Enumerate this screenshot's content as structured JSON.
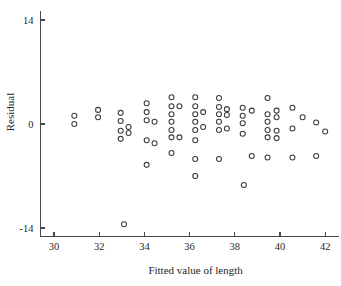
{
  "chart_data": {
    "type": "scatter",
    "title": "",
    "xlabel": "Fitted value of length",
    "ylabel": "Residual",
    "xlim": [
      29.4,
      42.6
    ],
    "ylim": [
      -15.2,
      15.2
    ],
    "xticks": [
      30,
      32,
      34,
      36,
      38,
      40,
      42
    ],
    "xticklabels": [
      "30",
      "32",
      "34",
      "36",
      "38",
      "40",
      "42"
    ],
    "yticks": [
      14,
      0,
      -14
    ],
    "yticklabels": [
      "14",
      "0",
      "-14"
    ],
    "grid": false,
    "legend": null,
    "marker": "open-circle",
    "marker_color": "#3b3b3b",
    "series": [
      {
        "name": "residuals",
        "points": [
          [
            30.9,
            1.1
          ],
          [
            30.9,
            0.0
          ],
          [
            31.95,
            1.9
          ],
          [
            31.95,
            0.9
          ],
          [
            32.95,
            1.5
          ],
          [
            32.95,
            0.4
          ],
          [
            32.95,
            -0.9
          ],
          [
            32.95,
            -2.0
          ],
          [
            33.3,
            -0.4
          ],
          [
            33.3,
            -1.2
          ],
          [
            33.1,
            -13.5
          ],
          [
            34.1,
            2.8
          ],
          [
            34.1,
            1.6
          ],
          [
            34.1,
            0.5
          ],
          [
            34.1,
            -2.2
          ],
          [
            34.45,
            0.3
          ],
          [
            34.45,
            -2.6
          ],
          [
            34.1,
            -5.5
          ],
          [
            35.2,
            3.6
          ],
          [
            35.2,
            2.4
          ],
          [
            35.2,
            1.3
          ],
          [
            35.2,
            0.3
          ],
          [
            35.2,
            -0.8
          ],
          [
            35.2,
            -1.8
          ],
          [
            35.2,
            -3.9
          ],
          [
            35.55,
            2.4
          ],
          [
            35.55,
            -1.8
          ],
          [
            36.25,
            3.6
          ],
          [
            36.25,
            2.4
          ],
          [
            36.25,
            1.3
          ],
          [
            36.25,
            0.3
          ],
          [
            36.25,
            -0.8
          ],
          [
            36.25,
            -2.2
          ],
          [
            36.25,
            -4.7
          ],
          [
            36.25,
            -7.0
          ],
          [
            36.6,
            1.6
          ],
          [
            36.6,
            -0.4
          ],
          [
            37.3,
            3.5
          ],
          [
            37.3,
            2.3
          ],
          [
            37.3,
            1.3
          ],
          [
            37.3,
            0.3
          ],
          [
            37.3,
            -0.8
          ],
          [
            37.3,
            -4.7
          ],
          [
            37.65,
            2.0
          ],
          [
            37.65,
            1.2
          ],
          [
            37.65,
            -0.6
          ],
          [
            38.35,
            2.2
          ],
          [
            38.35,
            1.1
          ],
          [
            38.35,
            0.1
          ],
          [
            38.35,
            -1.3
          ],
          [
            38.4,
            -8.2
          ],
          [
            38.75,
            1.8
          ],
          [
            38.75,
            -4.3
          ],
          [
            39.45,
            3.5
          ],
          [
            39.45,
            1.3
          ],
          [
            39.45,
            0.3
          ],
          [
            39.45,
            -0.8
          ],
          [
            39.45,
            -1.8
          ],
          [
            39.45,
            -4.5
          ],
          [
            39.85,
            1.8
          ],
          [
            39.85,
            0.9
          ],
          [
            39.85,
            -0.9
          ],
          [
            39.85,
            -1.9
          ],
          [
            40.55,
            2.2
          ],
          [
            40.55,
            -0.6
          ],
          [
            40.55,
            -4.5
          ],
          [
            41.0,
            0.9
          ],
          [
            41.6,
            0.2
          ],
          [
            41.6,
            -4.3
          ],
          [
            42.0,
            -1.0
          ]
        ]
      }
    ]
  },
  "axes": {
    "x_label": "Fitted value of length",
    "y_label": "Residual",
    "x_tick_labels": [
      "30",
      "32",
      "34",
      "36",
      "38",
      "40",
      "42"
    ],
    "y_tick_labels": [
      "14",
      "0",
      "-14"
    ]
  },
  "colors": {
    "marker_stroke": "#3b3b3b",
    "axis": "#4a4a4a",
    "text": "#1f1f1f",
    "background": "#ffffff"
  }
}
